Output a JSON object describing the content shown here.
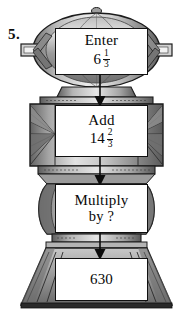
{
  "problem": {
    "number": "5."
  },
  "machine": {
    "description": "function-machine-illustration",
    "colors": {
      "body_light": "#d8d8d8",
      "body_mid": "#a8a8a8",
      "body_dark": "#6e6e6e",
      "outline": "#1a1a1a",
      "box_fill": "#ffffff",
      "ink": "#0d0d0d"
    },
    "steps": [
      {
        "id": "enter",
        "line1": "Enter",
        "value_whole": "6",
        "value_numerator": "1",
        "value_denominator": "3"
      },
      {
        "id": "add",
        "line1": "Add",
        "value_whole": "14",
        "value_numerator": "2",
        "value_denominator": "3"
      },
      {
        "id": "multiply",
        "line1": "Multiply",
        "line2": "by ?"
      },
      {
        "id": "result",
        "line1": "630"
      }
    ],
    "arrows": [
      {
        "id": "arrow-enter-to-add",
        "direction": "down"
      },
      {
        "id": "arrow-add-to-multiply",
        "direction": "down"
      },
      {
        "id": "arrow-multiply-to-result",
        "direction": "down"
      }
    ]
  }
}
